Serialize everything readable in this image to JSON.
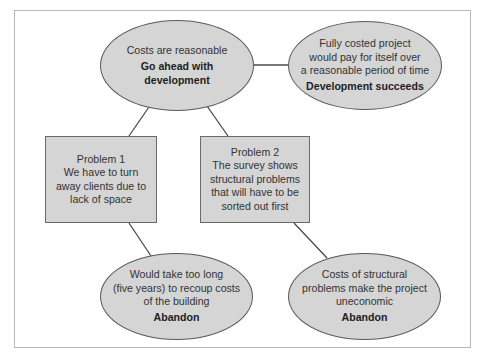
{
  "diagram": {
    "type": "decision-flow",
    "colors": {
      "node_fill": "#d5d5d5",
      "node_border": "#5a5a5a",
      "connector": "#4a4a4a",
      "frame_border": "#b8b8b8",
      "text": "#333333"
    },
    "nodes": [
      {
        "id": "costs-reasonable",
        "shape": "ellipse",
        "lines": [
          "Costs are reasonable"
        ],
        "outcome": [
          "Go ahead with",
          "development"
        ]
      },
      {
        "id": "development-succeeds",
        "shape": "ellipse",
        "lines": [
          "Fully costed project",
          "would pay for itself over",
          "a reasonable period of time"
        ],
        "outcome": [
          "Development succeeds"
        ]
      },
      {
        "id": "problem-1",
        "shape": "rectangle",
        "lines": [
          "Problem 1",
          "We have to turn",
          "away clients due to",
          "lack of space"
        ]
      },
      {
        "id": "problem-2",
        "shape": "rectangle",
        "lines": [
          "Problem 2",
          "The survey shows",
          "structural problems",
          "that will have to be",
          "sorted out first"
        ]
      },
      {
        "id": "abandon-1",
        "shape": "ellipse",
        "lines": [
          "Would take too long",
          "(five years) to recoup costs",
          "of the building"
        ],
        "outcome": [
          "Abandon"
        ]
      },
      {
        "id": "abandon-2",
        "shape": "ellipse",
        "lines": [
          "Costs of structural",
          "problems make the project",
          "uneconomic"
        ],
        "outcome": [
          "Abandon"
        ]
      }
    ],
    "edges": [
      {
        "from": "costs-reasonable",
        "to": "development-succeeds"
      },
      {
        "from": "costs-reasonable",
        "to": "problem-1"
      },
      {
        "from": "costs-reasonable",
        "to": "problem-2"
      },
      {
        "from": "problem-1",
        "to": "abandon-1"
      },
      {
        "from": "problem-2",
        "to": "abandon-2"
      }
    ]
  }
}
